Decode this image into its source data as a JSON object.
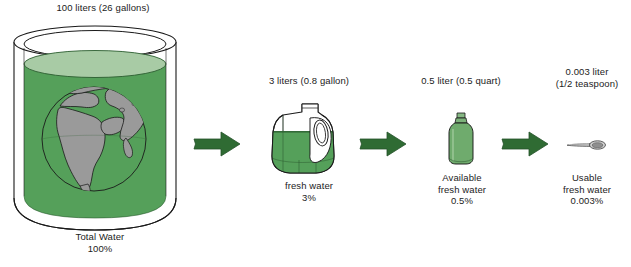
{
  "diagram": {
    "title_semantic": "world-water-availability-diagram",
    "colors": {
      "water_green": "#55a05a",
      "water_green_dark": "#3f8a48",
      "water_surface_light": "#a8cba5",
      "bottle_green": "#6fab6d",
      "arrow_green": "#2f6b33",
      "land_grey": "#9a9a9a",
      "outline": "#1a1a1a",
      "background": "#ffffff",
      "text": "#1c1c1c"
    },
    "stages": [
      {
        "id": "total-water",
        "icon": "cylinder-of-water-with-globe-icon",
        "top_label": "100 liters (26 gallons)",
        "bottom_lines": [
          "Total Water",
          "100%"
        ],
        "volume_liters": 100,
        "volume_us": "26 gallons",
        "percent": "100%"
      },
      {
        "id": "fresh-water",
        "icon": "water-jug-icon",
        "top_label": "3 liters (0.8 gallon)",
        "bottom_lines": [
          "fresh water",
          "3%"
        ],
        "volume_liters": 3,
        "volume_us": "0.8 gallon",
        "percent": "3%"
      },
      {
        "id": "available-fresh-water",
        "icon": "water-bottle-icon",
        "top_label": "0.5 liter (0.5 quart)",
        "bottom_lines": [
          "Available",
          "fresh water",
          "0.5%"
        ],
        "volume_liters": 0.5,
        "volume_us": "0.5 quart",
        "percent": "0.5%"
      },
      {
        "id": "usable-fresh-water",
        "icon": "teaspoon-icon",
        "top_lines": [
          "0.003 liter",
          "(1/2 teaspoon)"
        ],
        "bottom_lines": [
          "Usable",
          "fresh water",
          "0.003%"
        ],
        "volume_liters": 0.003,
        "volume_us": "1/2 teaspoon",
        "percent": "0.003%"
      }
    ],
    "arrows": [
      {
        "id": "arrow-total-to-fresh",
        "icon": "right-arrow-icon"
      },
      {
        "id": "arrow-fresh-to-available",
        "icon": "right-arrow-icon"
      },
      {
        "id": "arrow-available-to-usable",
        "icon": "right-arrow-icon"
      }
    ],
    "text": {
      "cyl_top": "100 liters (26 gallons)",
      "cyl_b1": "Total Water",
      "cyl_b2": "100%",
      "jug_top": "3 liters (0.8 gallon)",
      "jug_b1": "fresh water",
      "jug_b2": "3%",
      "bottle_top": "0.5 liter (0.5 quart)",
      "bottle_b1": "Available",
      "bottle_b2": "fresh water",
      "bottle_b3": "0.5%",
      "spoon_t1": "0.003 liter",
      "spoon_t2": "(1/2 teaspoon)",
      "spoon_b1": "Usable",
      "spoon_b2": "fresh water",
      "spoon_b3": "0.003%"
    }
  }
}
